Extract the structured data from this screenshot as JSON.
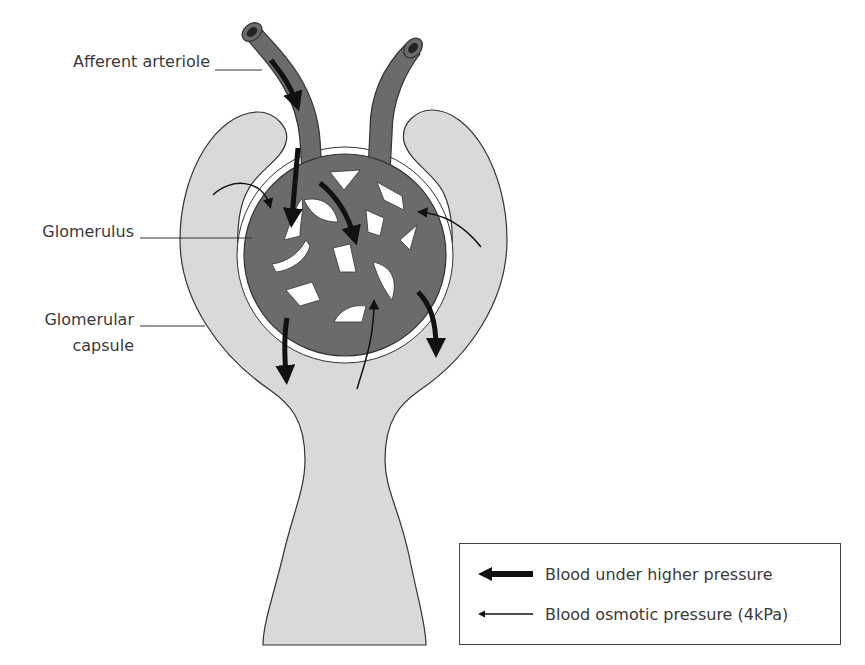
{
  "diagram": {
    "labels": {
      "afferent_arteriole": "Afferent arteriole",
      "glomerulus": "Glomerulus",
      "glomerular_capsule_line1": "Glomerular",
      "glomerular_capsule_line2": "capsule"
    },
    "legend": {
      "items": [
        {
          "icon": "thick-arrow-left-icon",
          "label": "Blood under higher pressure"
        },
        {
          "icon": "thin-arrow-left-icon",
          "label": "Blood osmotic pressure (4kPa)"
        }
      ]
    },
    "colors": {
      "capsule_fill": "#d9d9d9",
      "vessel_fill": "#6b6b6b",
      "outline": "#333333",
      "arrow": "#111111",
      "background": "#ffffff"
    }
  }
}
